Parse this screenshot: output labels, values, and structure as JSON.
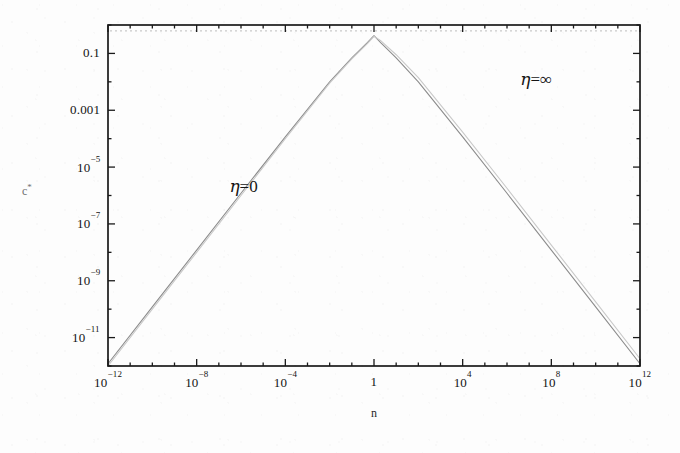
{
  "chart_data": {
    "type": "line",
    "title": "",
    "xlabel": "n",
    "ylabel": "c*",
    "xscale": "log",
    "yscale": "log",
    "xlim": [
      1e-12,
      1000000000000.0
    ],
    "ylim": [
      1e-12,
      1.0
    ],
    "grid": false,
    "legend_position": "inline-annotations",
    "xticklabels": [
      "10⁻¹²",
      "10⁻⁸",
      "10⁻⁴",
      "1",
      "10⁴",
      "10⁸",
      "10¹²"
    ],
    "xtick_mantissa": [
      "10",
      "10",
      "10",
      "1",
      "10",
      "10",
      "10"
    ],
    "xtick_exponent": [
      "-12",
      "-8",
      "-4",
      "",
      "4",
      "8",
      "12"
    ],
    "xtick_values": [
      1e-12,
      1e-08,
      0.0001,
      1,
      10000.0,
      100000000.0,
      1000000000000.0
    ],
    "yticklabels": [
      "0.1",
      "0.001",
      "10⁻⁵",
      "10⁻⁷",
      "10⁻⁹",
      "10⁻¹¹"
    ],
    "ytick_mantissa": [
      "0.1",
      "0.001",
      "10",
      "10",
      "10",
      "10"
    ],
    "ytick_exponent": [
      "",
      "",
      "-5",
      "-7",
      "-9",
      "-11"
    ],
    "ytick_values": [
      0.1,
      0.001,
      1e-05,
      1e-07,
      1e-09,
      1e-11
    ],
    "annotations": [
      {
        "text": "η=0",
        "eta": "η",
        "rest": "=0",
        "x": 3e-07,
        "y": 2e-06
      },
      {
        "text": "η=∞",
        "eta": "η",
        "rest": "=∞",
        "x": 4000000.0,
        "y": 0.012
      }
    ],
    "series": [
      {
        "name": "η=0",
        "color": "#8c8c8c",
        "width": 1.1,
        "points": [
          [
            1e-12,
            1.2e-12
          ],
          [
            1e-10,
            1.2e-10
          ],
          [
            1e-08,
            1.2e-08
          ],
          [
            1e-06,
            1.2e-06
          ],
          [
            0.0001,
            0.000115
          ],
          [
            0.01,
            0.01
          ],
          [
            0.1,
            0.07
          ],
          [
            0.5,
            0.24
          ],
          [
            1,
            0.42
          ],
          [
            2,
            0.24
          ],
          [
            10,
            0.07
          ],
          [
            100.0,
            0.01
          ],
          [
            10000.0,
            0.000115
          ],
          [
            1000000.0,
            1.2e-06
          ],
          [
            100000000.0,
            1.2e-08
          ],
          [
            10000000000.0,
            1.2e-10
          ],
          [
            1000000000000.0,
            1.2e-12
          ]
        ]
      },
      {
        "name": "η=∞",
        "color": "#c9c9c9",
        "width": 1.1,
        "points": [
          [
            1e-12,
            1e-12
          ],
          [
            1e-10,
            1e-10
          ],
          [
            1e-08,
            1e-08
          ],
          [
            1e-06,
            1e-06
          ],
          [
            0.0001,
            0.0001
          ],
          [
            0.01,
            0.009
          ],
          [
            0.1,
            0.064
          ],
          [
            0.5,
            0.22
          ],
          [
            1,
            0.4
          ],
          [
            2,
            0.28
          ],
          [
            10,
            0.09
          ],
          [
            100.0,
            0.014
          ],
          [
            10000.0,
            0.00017
          ],
          [
            1000000.0,
            1.8e-06
          ],
          [
            100000000.0,
            1.8e-08
          ],
          [
            10000000000.0,
            1.8e-10
          ],
          [
            1000000000000.0,
            1.8e-12
          ]
        ]
      }
    ],
    "asymptote": {
      "name": "upper-asymptote",
      "y": 0.62,
      "color": "#bdbdbd",
      "dash": "2 3"
    }
  },
  "axes": {
    "frame_color": "#1a1a1a",
    "tick_color": "#1a1a1a"
  }
}
